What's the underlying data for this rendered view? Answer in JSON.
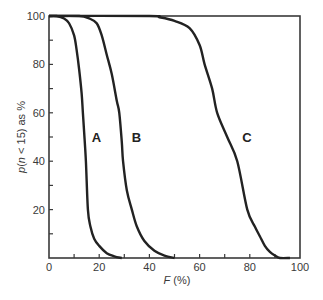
{
  "chart_data": {
    "type": "line",
    "title": "",
    "xlabel": "F (%)",
    "ylabel": "p(n < 15) as %",
    "xlim": [
      0,
      100
    ],
    "ylim": [
      0,
      100
    ],
    "xticks": [
      0,
      20,
      40,
      60,
      80,
      100
    ],
    "yticks": [
      20,
      40,
      60,
      80,
      100
    ],
    "x_minor_step": 10,
    "y_minor_step": 10,
    "grid": false,
    "legend": "inline labels",
    "series": [
      {
        "name": "A",
        "label_pos": [
          17,
          48
        ],
        "x": [
          0,
          3,
          6,
          8,
          10,
          11,
          12,
          13,
          13.5,
          14,
          14.7,
          15.5,
          16.5,
          18,
          20,
          23,
          26,
          29
        ],
        "y": [
          100,
          100,
          99,
          97,
          92,
          86,
          78,
          68,
          60,
          52,
          40,
          20,
          13,
          8,
          5,
          2,
          0.7,
          0
        ]
      },
      {
        "name": "B",
        "label_pos": [
          33,
          48
        ],
        "x": [
          0,
          12,
          16,
          19,
          21,
          23,
          25,
          27,
          28,
          29,
          29.5,
          31,
          33,
          35,
          38,
          42,
          46,
          50
        ],
        "y": [
          100,
          100,
          99,
          97,
          92,
          84,
          76,
          65,
          60,
          48,
          40,
          28,
          20,
          13,
          7,
          3,
          1,
          0
        ]
      },
      {
        "name": "C",
        "label_pos": [
          77,
          48
        ],
        "x": [
          0,
          40,
          44,
          50,
          56,
          60,
          62,
          65,
          67,
          71,
          75,
          79,
          82,
          84,
          86,
          88,
          90,
          92,
          96
        ],
        "y": [
          100,
          100,
          99.5,
          98,
          95,
          88,
          80,
          70,
          60,
          50,
          40,
          20,
          13,
          9,
          5,
          2.5,
          1,
          0,
          0
        ]
      }
    ]
  }
}
